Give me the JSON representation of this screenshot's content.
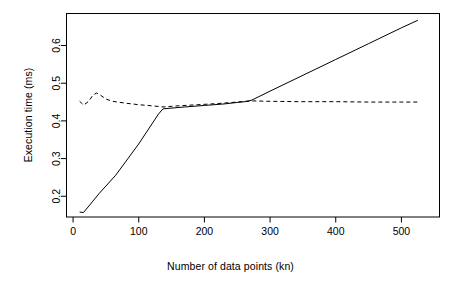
{
  "chart_data": {
    "type": "line",
    "title": "",
    "xlabel": "Number of data points (kn)",
    "ylabel": "Execution time (ms)",
    "xlim": [
      -10,
      558
    ],
    "ylim": [
      0.145,
      0.685
    ],
    "grid": false,
    "legend": "none",
    "xticks": [
      0,
      100,
      200,
      300,
      400,
      500
    ],
    "xticklabels": [
      "0",
      "100",
      "200",
      "300",
      "400",
      "500"
    ],
    "yticks": [
      0.2,
      0.3,
      0.4,
      0.5,
      0.6
    ],
    "yticklabels": [
      "0.2",
      "0.3",
      "0.4",
      "0.5",
      "0.6"
    ],
    "series": [
      {
        "name": "solid",
        "style": "solid",
        "color": "#000000",
        "x": [
          10,
          16,
          40,
          65,
          100,
          130,
          137,
          170,
          200,
          230,
          250,
          262,
          272,
          300,
          350,
          400,
          450,
          500,
          525
        ],
        "y": [
          0.158,
          0.157,
          0.208,
          0.256,
          0.339,
          0.418,
          0.432,
          0.437,
          0.441,
          0.445,
          0.449,
          0.451,
          0.455,
          0.479,
          0.521,
          0.563,
          0.605,
          0.647,
          0.667
        ]
      },
      {
        "name": "dashed",
        "style": "dashed",
        "color": "#000000",
        "x": [
          10,
          16,
          24,
          30,
          36,
          42,
          50,
          60,
          80,
          100,
          120,
          137,
          160,
          190,
          220,
          250,
          262,
          275,
          300,
          350,
          400,
          450,
          500,
          525
        ],
        "y": [
          0.452,
          0.442,
          0.452,
          0.468,
          0.474,
          0.468,
          0.458,
          0.452,
          0.447,
          0.443,
          0.44,
          0.437,
          0.44,
          0.443,
          0.446,
          0.45,
          0.452,
          0.453,
          0.452,
          0.451,
          0.451,
          0.45,
          0.45,
          0.45
        ]
      }
    ]
  },
  "axes": {
    "x_title": "Number of data points (kn)",
    "y_title": "Execution time (ms)"
  }
}
